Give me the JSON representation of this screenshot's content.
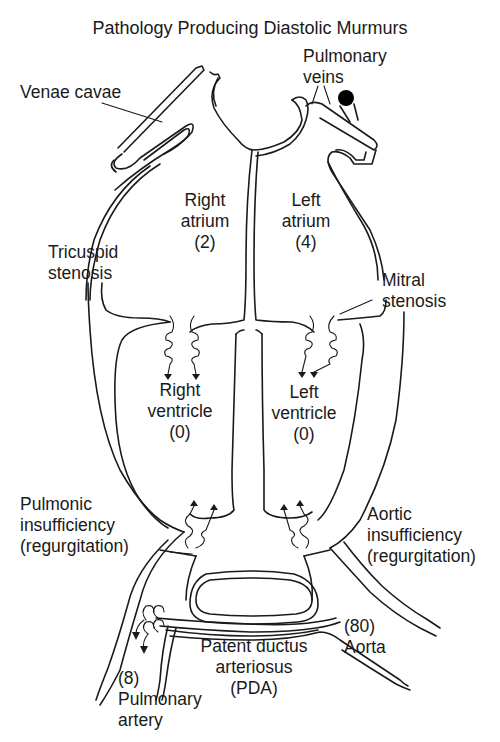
{
  "title": "Pathology Producing Diastolic Murmurs",
  "labels": {
    "venae_cavae": "Venae cavae",
    "pulmonary_veins": [
      "Pulmonary",
      "veins"
    ],
    "right_atrium": [
      "Right",
      "atrium",
      "(2)"
    ],
    "left_atrium": [
      "Left",
      "atrium",
      "(4)"
    ],
    "tricuspid_stenosis": [
      "Tricuspid",
      "stenosis"
    ],
    "mitral_stenosis": [
      "Mitral",
      "stenosis"
    ],
    "right_ventricle": [
      "Right",
      "ventricle",
      "(0)"
    ],
    "left_ventricle": [
      "Left",
      "ventricle",
      "(0)"
    ],
    "pulmonic_insufficiency": [
      "Pulmonic",
      "insufficiency",
      "(regurgitation)"
    ],
    "aortic_insufficiency": [
      "Aortic",
      "insufficiency",
      "(regurgitation)"
    ],
    "aorta": [
      "(80)",
      "Aorta"
    ],
    "pda": [
      "Patent ductus",
      "arteriosus",
      "(PDA)"
    ],
    "pulmonary_artery": [
      "(8)",
      "Pulmonary",
      "artery"
    ]
  },
  "pressures_mmHg": {
    "right_atrium": 2,
    "left_atrium": 4,
    "right_ventricle": 0,
    "left_ventricle": 0,
    "aorta": 80,
    "pulmonary_artery": 8
  },
  "colors": {
    "ink": "#1a1a1a",
    "background": "#ffffff"
  }
}
